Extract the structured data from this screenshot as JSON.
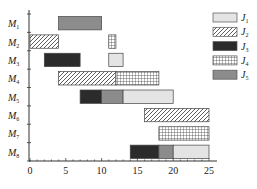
{
  "chart_data": {
    "type": "gantt",
    "title": "",
    "xlabel": "",
    "ylabel": "",
    "xlim": [
      0,
      25
    ],
    "xticks": [
      0,
      5,
      10,
      15,
      20,
      25
    ],
    "machines": [
      "M1",
      "M2",
      "M3",
      "M4",
      "M5",
      "M6",
      "M7",
      "M8"
    ],
    "jobs": [
      {
        "id": "J1",
        "label": "J",
        "sub": "1",
        "fill": "#e4e4e4",
        "pattern": "solid"
      },
      {
        "id": "J2",
        "label": "J",
        "sub": "2",
        "fill": "#ffffff",
        "pattern": "diagonal"
      },
      {
        "id": "J3",
        "label": "J",
        "sub": "3",
        "fill": "#2b2b2b",
        "pattern": "solid"
      },
      {
        "id": "J4",
        "label": "J",
        "sub": "4",
        "fill": "#ffffff",
        "pattern": "grid"
      },
      {
        "id": "J5",
        "label": "J",
        "sub": "5",
        "fill": "#8c8c8c",
        "pattern": "solid"
      }
    ],
    "tasks": [
      {
        "machine": "M1",
        "job": "J5",
        "start": 4,
        "end": 10
      },
      {
        "machine": "M2",
        "job": "J2",
        "start": 0,
        "end": 4
      },
      {
        "machine": "M2",
        "job": "J4",
        "start": 11,
        "end": 12
      },
      {
        "machine": "M3",
        "job": "J3",
        "start": 2,
        "end": 7
      },
      {
        "machine": "M3",
        "job": "J1",
        "start": 11,
        "end": 13
      },
      {
        "machine": "M4",
        "job": "J2",
        "start": 4,
        "end": 12
      },
      {
        "machine": "M4",
        "job": "J4",
        "start": 12,
        "end": 18
      },
      {
        "machine": "M5",
        "job": "J3",
        "start": 7,
        "end": 10
      },
      {
        "machine": "M5",
        "job": "J5",
        "start": 10,
        "end": 13
      },
      {
        "machine": "M5",
        "job": "J1",
        "start": 13,
        "end": 20
      },
      {
        "machine": "M6",
        "job": "J2",
        "start": 16,
        "end": 25
      },
      {
        "machine": "M7",
        "job": "J4",
        "start": 18,
        "end": 25
      },
      {
        "machine": "M8",
        "job": "J3",
        "start": 14,
        "end": 18
      },
      {
        "machine": "M8",
        "job": "J5",
        "start": 18,
        "end": 20
      },
      {
        "machine": "M8",
        "job": "J1",
        "start": 20,
        "end": 25
      }
    ],
    "legend_position": "top-right",
    "grid": false
  }
}
